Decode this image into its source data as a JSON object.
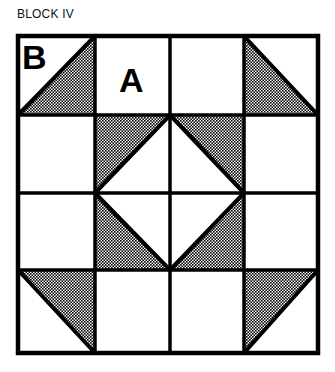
{
  "title": "BLOCK IV",
  "labels": {
    "b": "B",
    "a": "A"
  },
  "colors": {
    "line": "#000000",
    "background": "#ffffff",
    "shade_dot": "#000000"
  },
  "grid": {
    "rows": 4,
    "cols": 4,
    "x_lines": [
      18,
      95,
      170,
      244,
      318
    ],
    "y_lines": [
      36,
      115,
      193,
      270,
      353
    ]
  },
  "cells": [
    {
      "row": 0,
      "col": 0,
      "shaded": "lower-right-triangle",
      "label": "B"
    },
    {
      "row": 0,
      "col": 1,
      "shaded": "none",
      "label": "A"
    },
    {
      "row": 0,
      "col": 2,
      "shaded": "none"
    },
    {
      "row": 0,
      "col": 3,
      "shaded": "lower-left-triangle"
    },
    {
      "row": 1,
      "col": 0,
      "shaded": "none"
    },
    {
      "row": 1,
      "col": 1,
      "shaded": "upper-left-triangle"
    },
    {
      "row": 1,
      "col": 2,
      "shaded": "upper-right-triangle"
    },
    {
      "row": 1,
      "col": 3,
      "shaded": "none"
    },
    {
      "row": 2,
      "col": 0,
      "shaded": "none"
    },
    {
      "row": 2,
      "col": 1,
      "shaded": "lower-left-triangle"
    },
    {
      "row": 2,
      "col": 2,
      "shaded": "lower-right-triangle"
    },
    {
      "row": 2,
      "col": 3,
      "shaded": "none"
    },
    {
      "row": 3,
      "col": 0,
      "shaded": "upper-right-triangle"
    },
    {
      "row": 3,
      "col": 1,
      "shaded": "none"
    },
    {
      "row": 3,
      "col": 2,
      "shaded": "none"
    },
    {
      "row": 3,
      "col": 3,
      "shaded": "upper-left-triangle"
    }
  ]
}
